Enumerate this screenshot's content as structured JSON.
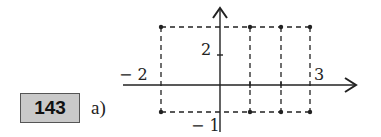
{
  "exercise": {
    "number": "143",
    "part": "a)"
  },
  "diagram": {
    "axis_labels": {
      "y_pos": "2",
      "x_neg": "− 2",
      "x_pos": "3",
      "y_neg": "− 1"
    },
    "rectangle": {
      "x_min": -2,
      "x_max": 3,
      "y_min": -1,
      "y_max": 2
    },
    "interior_verticals_x": [
      1,
      2
    ],
    "points": [
      [
        -2,
        2
      ],
      [
        1,
        2
      ],
      [
        2,
        2
      ],
      [
        3,
        2
      ],
      [
        -2,
        -1
      ],
      [
        1,
        -1
      ],
      [
        2,
        -1
      ],
      [
        3,
        -1
      ]
    ],
    "line_color": "#222222",
    "dash_style": "dashed"
  }
}
